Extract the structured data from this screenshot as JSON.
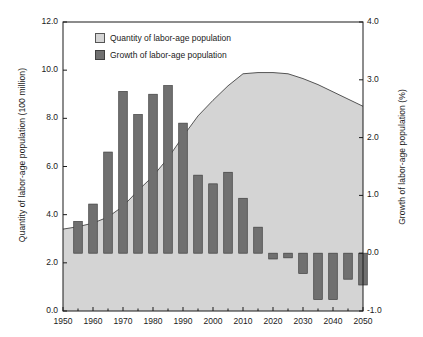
{
  "axes": {
    "left_title": "Quantity of labor-age population (100 million)",
    "right_title": "Growth of labor-age population (%)",
    "left_ticks": [
      "12.0",
      "10.0",
      "8.0",
      "6.0",
      "4.0",
      "2.0",
      "0.0"
    ],
    "right_ticks": [
      "4.0",
      "3.0",
      "2.0",
      "1.0",
      "0.0",
      "-1.0"
    ],
    "x_ticks": [
      "1950",
      "1960",
      "1970",
      "1980",
      "1990",
      "2000",
      "2010",
      "2020",
      "2030",
      "2040",
      "2050"
    ]
  },
  "legend": {
    "items": [
      {
        "label": "Quantity of labor-age population",
        "swatch": "area-swatch",
        "color": "#d4d4d4"
      },
      {
        "label": "Growth of labor-age population",
        "swatch": "bar-swatch",
        "color": "#707070"
      }
    ]
  },
  "colors": {
    "area_fill": "#d4d4d4",
    "area_line": "#444444",
    "bar_fill": "#707070",
    "bar_stroke": "#3f3f3f",
    "axis": "#1a1a1a"
  },
  "chart_data": {
    "type": "bar",
    "title": "",
    "xlabel": "",
    "ylabel": "Quantity of labor-age population (100 million)",
    "y2label": "Growth of labor-age population (%)",
    "xlim": [
      1950,
      2050
    ],
    "ylim": [
      0.0,
      12.0
    ],
    "y2lim": [
      -1.0,
      4.0
    ],
    "grid": false,
    "legend_position": "top-left",
    "series": [
      {
        "name": "Quantity of labor-age population",
        "type": "area",
        "axis": "left",
        "unit": "100 million",
        "x": [
          1950,
          1955,
          1960,
          1965,
          1970,
          1975,
          1980,
          1985,
          1990,
          1995,
          2000,
          2005,
          2010,
          2015,
          2020,
          2025,
          2030,
          2035,
          2040,
          2045,
          2050
        ],
        "values": [
          3.4,
          3.5,
          3.65,
          3.9,
          4.35,
          5.0,
          5.6,
          6.35,
          7.25,
          8.1,
          8.75,
          9.35,
          9.85,
          9.9,
          9.9,
          9.85,
          9.65,
          9.4,
          9.1,
          8.8,
          8.5
        ]
      },
      {
        "name": "Growth of labor-age population",
        "type": "bar",
        "axis": "right",
        "unit": "%",
        "x": [
          1955,
          1960,
          1965,
          1970,
          1975,
          1980,
          1985,
          1990,
          1995,
          2000,
          2005,
          2010,
          2015,
          2020,
          2025,
          2030,
          2035,
          2040,
          2045,
          2050
        ],
        "values": [
          0.55,
          0.85,
          1.75,
          2.8,
          2.4,
          2.75,
          2.9,
          2.25,
          1.35,
          1.2,
          1.4,
          0.95,
          0.45,
          -0.1,
          -0.08,
          -0.35,
          -0.8,
          -0.8,
          -0.45,
          -0.55
        ]
      }
    ]
  }
}
